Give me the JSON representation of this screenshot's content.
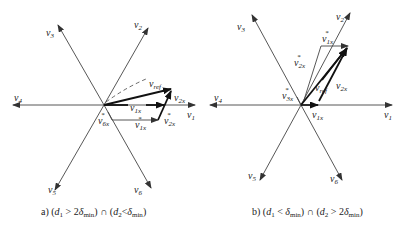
{
  "panels": [
    {
      "id": "a",
      "caption": {
        "prefix": "a) (",
        "d1": "d",
        "d1_sub": "1",
        "op1": " > 2",
        "delta1": "δ",
        "delta1_sub": "min",
        "mid": ") ∩ (",
        "d2": "d",
        "d2_sub": "2",
        "op2": "<",
        "delta2": "δ",
        "delta2_sub": "min",
        "suffix": ")"
      },
      "axes": [
        {
          "name": "v",
          "sub": "1"
        },
        {
          "name": "v",
          "sub": "2"
        },
        {
          "name": "v",
          "sub": "3"
        },
        {
          "name": "v",
          "sub": "4"
        },
        {
          "name": "v",
          "sub": "5"
        },
        {
          "name": "v",
          "sub": "6"
        }
      ],
      "vectors": {
        "vref": {
          "name": "v",
          "sub": "ref"
        },
        "v1x": {
          "name": "v",
          "sub": "1x"
        },
        "v2x": {
          "name": "v",
          "sub": "2x"
        },
        "v1x_star": {
          "name": "v",
          "sub": "1x",
          "sup": "*"
        },
        "v2x_star": {
          "name": "v",
          "sub": "2x",
          "sup": "*"
        },
        "v6x_star": {
          "name": "v",
          "sub": "6x",
          "sup": "*"
        }
      }
    },
    {
      "id": "b",
      "caption": {
        "prefix": "b) (",
        "d1": "d",
        "d1_sub": "1",
        "op1": " < ",
        "delta1": "δ",
        "delta1_sub": "min",
        "mid": ") ∩ (",
        "d2": "d",
        "d2_sub": "2",
        "op2": " > 2",
        "delta2": "δ",
        "delta2_sub": "min",
        "suffix": ")"
      },
      "axes": [
        {
          "name": "v",
          "sub": "1"
        },
        {
          "name": "v",
          "sub": "2"
        },
        {
          "name": "v",
          "sub": "3"
        },
        {
          "name": "v",
          "sub": "4"
        },
        {
          "name": "v",
          "sub": "5"
        },
        {
          "name": "v",
          "sub": "6"
        }
      ],
      "vectors": {
        "vref": {
          "name": "v",
          "sub": "ref"
        },
        "v1x": {
          "name": "v",
          "sub": "1x"
        },
        "v2x": {
          "name": "v",
          "sub": "2x"
        },
        "v1x_star": {
          "name": "v",
          "sub": "1x",
          "sup": "*"
        },
        "v2x_star": {
          "name": "v",
          "sub": "2x",
          "sup": "*"
        },
        "v3x_star": {
          "name": "v",
          "sub": "3x",
          "sup": "*"
        }
      }
    }
  ],
  "colors": {
    "line": "#333333",
    "bold": "#111111",
    "text": "#222222"
  }
}
